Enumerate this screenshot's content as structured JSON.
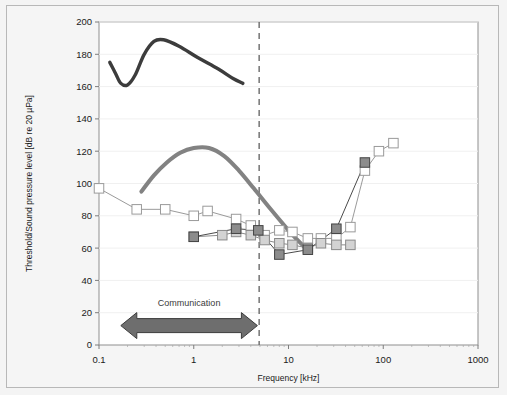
{
  "chart_data": {
    "type": "line",
    "title": "",
    "xlabel": "Frequency [kHz]",
    "ylabel": "Threshold/Sound pressure level [dB re 20 µPa]",
    "xscale": "log",
    "xlim": [
      0.1,
      1000
    ],
    "ylim": [
      0,
      200
    ],
    "xticks": [
      0.1,
      1,
      10,
      100,
      1000
    ],
    "xtick_labels": [
      "0.1",
      "1",
      "10",
      "100",
      "1000"
    ],
    "yticks": [
      0,
      20,
      40,
      60,
      80,
      100,
      120,
      140,
      160,
      180,
      200
    ],
    "ytick_labels": [
      "0",
      "20",
      "40",
      "60",
      "80",
      "100",
      "120",
      "140",
      "160",
      "180",
      "200"
    ],
    "grid": false,
    "legend": "none",
    "series": [
      {
        "name": "audiogram-open-squares",
        "marker": "square",
        "marker_fill": "#ffffff",
        "marker_edge": "#9a9a9a",
        "line_color": "#9a9a9a",
        "points": [
          {
            "x": 0.1,
            "y": 97
          },
          {
            "x": 0.25,
            "y": 84
          },
          {
            "x": 0.5,
            "y": 84
          },
          {
            "x": 1.0,
            "y": 80
          },
          {
            "x": 1.4,
            "y": 83
          },
          {
            "x": 2.8,
            "y": 78
          },
          {
            "x": 4.0,
            "y": 74
          },
          {
            "x": 5.6,
            "y": 68
          },
          {
            "x": 8.0,
            "y": 71
          },
          {
            "x": 11.0,
            "y": 70
          },
          {
            "x": 16.0,
            "y": 66
          },
          {
            "x": 22.0,
            "y": 66
          },
          {
            "x": 32.0,
            "y": 66
          },
          {
            "x": 45.0,
            "y": 73
          },
          {
            "x": 64.0,
            "y": 108
          },
          {
            "x": 90.0,
            "y": 120
          },
          {
            "x": 128.0,
            "y": 125
          }
        ]
      },
      {
        "name": "audiogram-light-gray-squares",
        "marker": "square",
        "marker_fill": "#d3d3d3",
        "marker_edge": "#8a8a8a",
        "line_color": "#8a8a8a",
        "points": [
          {
            "x": 1.0,
            "y": 67
          },
          {
            "x": 2.0,
            "y": 68
          },
          {
            "x": 2.8,
            "y": 70
          },
          {
            "x": 4.0,
            "y": 68
          },
          {
            "x": 5.6,
            "y": 65
          },
          {
            "x": 8.0,
            "y": 63
          },
          {
            "x": 11.0,
            "y": 62
          },
          {
            "x": 16.0,
            "y": 60
          },
          {
            "x": 22.0,
            "y": 63
          },
          {
            "x": 32.0,
            "y": 62
          },
          {
            "x": 45.0,
            "y": 62
          }
        ]
      },
      {
        "name": "audiogram-dark-gray-squares",
        "marker": "square",
        "marker_fill": "#8c8c8c",
        "marker_edge": "#444444",
        "line_color": "#4a4a4a",
        "points": [
          {
            "x": 1.0,
            "y": 67
          },
          {
            "x": 2.8,
            "y": 72
          },
          {
            "x": 4.8,
            "y": 71
          },
          {
            "x": 8.0,
            "y": 56
          },
          {
            "x": 16.0,
            "y": 59
          },
          {
            "x": 32.0,
            "y": 72
          },
          {
            "x": 64.0,
            "y": 113
          }
        ]
      }
    ],
    "curves": [
      {
        "name": "echolocation-click-spectrum",
        "color": "#3c3c3c",
        "width": 3.4,
        "points": [
          {
            "x": 0.13,
            "y": 175
          },
          {
            "x": 0.15,
            "y": 168
          },
          {
            "x": 0.17,
            "y": 162
          },
          {
            "x": 0.2,
            "y": 161
          },
          {
            "x": 0.24,
            "y": 167
          },
          {
            "x": 0.3,
            "y": 180
          },
          {
            "x": 0.38,
            "y": 188
          },
          {
            "x": 0.48,
            "y": 189
          },
          {
            "x": 0.7,
            "y": 185
          },
          {
            "x": 1.1,
            "y": 178
          },
          {
            "x": 1.8,
            "y": 171
          },
          {
            "x": 2.6,
            "y": 165
          },
          {
            "x": 3.3,
            "y": 162
          }
        ]
      },
      {
        "name": "communication-call-spectrum",
        "color": "#828282",
        "width": 4.0,
        "points": [
          {
            "x": 0.28,
            "y": 95
          },
          {
            "x": 0.38,
            "y": 105
          },
          {
            "x": 0.52,
            "y": 113
          },
          {
            "x": 0.72,
            "y": 119
          },
          {
            "x": 1.0,
            "y": 122
          },
          {
            "x": 1.45,
            "y": 122
          },
          {
            "x": 2.1,
            "y": 117
          },
          {
            "x": 3.0,
            "y": 108
          },
          {
            "x": 4.3,
            "y": 97
          },
          {
            "x": 6.5,
            "y": 84
          },
          {
            "x": 10.0,
            "y": 71
          },
          {
            "x": 14.0,
            "y": 62
          },
          {
            "x": 17.0,
            "y": 58
          }
        ]
      }
    ],
    "annotations": [
      {
        "name": "communication-band-marker",
        "label": "Communication",
        "type": "double-arrow",
        "x_start": 0.17,
        "x_end": 4.7,
        "y": 12,
        "label_y": 25,
        "color": "#6e6e6e",
        "edge_color": "#3c3c3c"
      },
      {
        "name": "frequency-divider",
        "type": "vertical-dashed-line",
        "x": 4.9,
        "color": "#6a6a6a"
      }
    ]
  }
}
